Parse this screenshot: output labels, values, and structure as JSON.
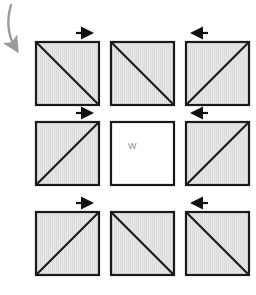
{
  "figure": {
    "title": "",
    "background_color": "#ffffff",
    "grid": {
      "rows": 3,
      "cols": 3,
      "cell_size_px": 65,
      "gap_px": 10,
      "origin_x_px": 35,
      "origin_y_px": 41
    },
    "style": {
      "square_fill": "#e4e4e4",
      "square_fill_hatch": "#d8d8d8",
      "square_stroke": "#1a1a1a",
      "square_stroke_width": 2,
      "diagonal_stroke": "#1a1a1a",
      "diagonal_stroke_width": 2,
      "arrow_color": "#111111",
      "curved_arrow_color": "#9b9b9b",
      "label_color": "#8a8a8a"
    },
    "curved_arrow": {
      "name": "rotation-arrow",
      "direction": "down",
      "color": "#9b9b9b",
      "start": [
        11,
        4
      ],
      "end": [
        16,
        52
      ]
    },
    "cells": [
      {
        "id": "cell-r1c1",
        "row": 1,
        "col": 1,
        "filled": true,
        "diagonal": "main",
        "label": "",
        "arrow": {
          "direction": "right",
          "symbol": "→"
        }
      },
      {
        "id": "cell-r1c2",
        "row": 1,
        "col": 2,
        "filled": true,
        "diagonal": "main",
        "label": "",
        "arrow": null
      },
      {
        "id": "cell-r1c3",
        "row": 1,
        "col": 3,
        "filled": true,
        "diagonal": "anti",
        "label": "",
        "arrow": {
          "direction": "left",
          "symbol": "←"
        }
      },
      {
        "id": "cell-r2c1",
        "row": 2,
        "col": 1,
        "filled": true,
        "diagonal": "anti",
        "label": "",
        "arrow": {
          "direction": "right",
          "symbol": "→"
        }
      },
      {
        "id": "cell-r2c2",
        "row": 2,
        "col": 2,
        "filled": false,
        "diagonal": "none",
        "label": "W",
        "arrow": null
      },
      {
        "id": "cell-r2c3",
        "row": 2,
        "col": 3,
        "filled": true,
        "diagonal": "anti",
        "label": "",
        "arrow": {
          "direction": "left",
          "symbol": "←"
        }
      },
      {
        "id": "cell-r3c1",
        "row": 3,
        "col": 1,
        "filled": true,
        "diagonal": "anti",
        "label": "",
        "arrow": {
          "direction": "right",
          "symbol": "→"
        }
      },
      {
        "id": "cell-r3c2",
        "row": 3,
        "col": 2,
        "filled": true,
        "diagonal": "main",
        "label": "",
        "arrow": null
      },
      {
        "id": "cell-r3c3",
        "row": 3,
        "col": 3,
        "filled": true,
        "diagonal": "main",
        "label": "",
        "arrow": {
          "direction": "left",
          "symbol": "←"
        }
      }
    ],
    "center_label": "W"
  }
}
